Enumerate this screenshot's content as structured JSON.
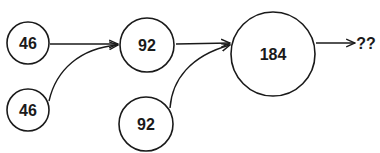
{
  "diagram": {
    "nodes": [
      {
        "id": "n1",
        "label": "46"
      },
      {
        "id": "n2",
        "label": "46"
      },
      {
        "id": "n3",
        "label": "92"
      },
      {
        "id": "n4",
        "label": "92"
      },
      {
        "id": "n5",
        "label": "184"
      }
    ],
    "output_label": "??",
    "edges": [
      {
        "from": "n1",
        "to": "n3"
      },
      {
        "from": "n2",
        "to": "n3"
      },
      {
        "from": "n3",
        "to": "n5"
      },
      {
        "from": "n4",
        "to": "n5"
      },
      {
        "from": "n5",
        "to": "output"
      }
    ],
    "colors": {
      "stroke": "#1a1a1a",
      "background": "#ffffff"
    }
  }
}
